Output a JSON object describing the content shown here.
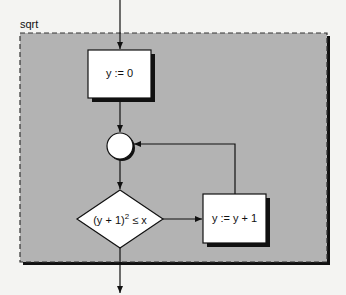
{
  "diagram": {
    "frame_label": "sqrt",
    "nodes": {
      "init": "y := 0",
      "condition_base": "(y + 1)",
      "condition_exp": "2",
      "condition_rest": " ≤ x",
      "increment": "y := y + 1"
    },
    "colors": {
      "frame_fill": "#b3b3b3",
      "node_fill": "#ffffff",
      "stroke": "#111111",
      "shadow": "#111111"
    }
  }
}
